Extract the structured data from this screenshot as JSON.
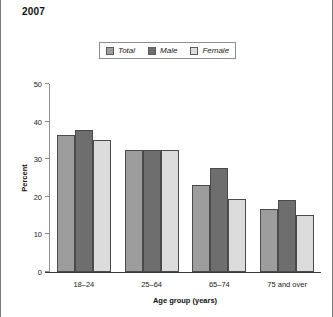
{
  "title": "2007",
  "legend": {
    "position": "top-center",
    "items": [
      {
        "label": "Total",
        "color": "#9d9d9d"
      },
      {
        "label": "Male",
        "color": "#6e6e6e"
      },
      {
        "label": "Female",
        "color": "#dcdcdc"
      }
    ]
  },
  "axes": {
    "y_title": "Percent",
    "x_title": "Age group (years)",
    "y_ticks": [
      "0",
      "10",
      "20",
      "30",
      "40",
      "50"
    ]
  },
  "chart_data": {
    "type": "bar",
    "title": "2007",
    "xlabel": "Age group (years)",
    "ylabel": "Percent",
    "ylim": [
      0,
      50
    ],
    "yticks": [
      0,
      10,
      20,
      30,
      40,
      50
    ],
    "grid": false,
    "legend_position": "top-center",
    "categories": [
      "18–24",
      "25–64",
      "65–74",
      "75 and over"
    ],
    "series": [
      {
        "name": "Total",
        "color": "#9d9d9d",
        "values": [
          36.4,
          32.5,
          23.2,
          16.8
        ]
      },
      {
        "name": "Male",
        "color": "#6e6e6e",
        "values": [
          37.8,
          32.5,
          27.7,
          19.1
        ]
      },
      {
        "name": "Female",
        "color": "#dcdcdc",
        "values": [
          35.1,
          32.5,
          19.4,
          15.2
        ]
      }
    ]
  }
}
